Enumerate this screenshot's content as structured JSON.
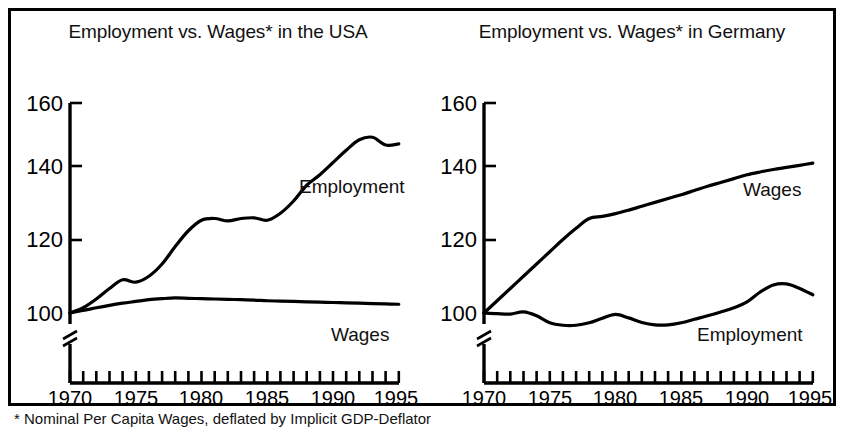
{
  "figure": {
    "footnote": "* Nominal Per Capita Wages, deflated by Implicit GDP-Deflator"
  },
  "chart_data": [
    {
      "type": "line",
      "title": "Employment vs. Wages* in the USA",
      "xlabel": "",
      "ylabel": "",
      "index_base": 100,
      "xlim": [
        1970,
        1995
      ],
      "ylim": [
        100,
        160
      ],
      "axis_break": true,
      "grid": false,
      "legend_position": "inline-labels",
      "xticks": [
        1970,
        1975,
        1980,
        1985,
        1990,
        1995
      ],
      "xtick_labels": [
        "1970",
        "1975",
        "1980",
        "1985",
        "1990",
        "1995"
      ],
      "minor_xticks_every": 1,
      "yticks": [
        100,
        120,
        140,
        160
      ],
      "ytick_labels": [
        "100",
        "120",
        "140",
        "160"
      ],
      "x": [
        1970,
        1971,
        1972,
        1973,
        1974,
        1975,
        1976,
        1977,
        1978,
        1979,
        1980,
        1981,
        1982,
        1983,
        1984,
        1985,
        1986,
        1987,
        1988,
        1989,
        1990,
        1991,
        1992,
        1993,
        1994,
        1995
      ],
      "series": [
        {
          "name": "Employment",
          "label": "Employment",
          "values": [
            100.0,
            101.5,
            104.0,
            107.0,
            109.5,
            108.8,
            110.5,
            114.0,
            119.0,
            123.5,
            126.5,
            127.0,
            126.3,
            127.0,
            127.2,
            126.5,
            128.5,
            132.0,
            136.5,
            139.5,
            143.0,
            146.5,
            149.5,
            150.2,
            148.0,
            148.3,
            155.0
          ]
        },
        {
          "name": "Wages",
          "label": "Wages",
          "values": [
            100.0,
            100.7,
            101.5,
            102.2,
            102.8,
            103.3,
            103.8,
            104.1,
            104.3,
            104.2,
            104.1,
            104.0,
            103.9,
            103.8,
            103.7,
            103.5,
            103.4,
            103.3,
            103.2,
            103.1,
            103.0,
            102.9,
            102.8,
            102.7,
            102.6,
            102.5
          ]
        }
      ]
    },
    {
      "type": "line",
      "title": "Employment vs. Wages* in Germany",
      "xlabel": "",
      "ylabel": "",
      "index_base": 100,
      "xlim": [
        1970,
        1995
      ],
      "ylim": [
        100,
        160
      ],
      "axis_break": true,
      "grid": false,
      "legend_position": "inline-labels",
      "xticks": [
        1970,
        1975,
        1980,
        1985,
        1990,
        1995
      ],
      "xtick_labels": [
        "1970",
        "1975",
        "1980",
        "1985",
        "1990",
        "1995"
      ],
      "minor_xticks_every": 1,
      "yticks": [
        100,
        120,
        140,
        160
      ],
      "ytick_labels": [
        "100",
        "120",
        "140",
        "160"
      ],
      "x": [
        1970,
        1971,
        1972,
        1973,
        1974,
        1975,
        1976,
        1977,
        1978,
        1979,
        1980,
        1981,
        1982,
        1983,
        1984,
        1985,
        1986,
        1987,
        1988,
        1989,
        1990,
        1991,
        1992,
        1993,
        1994,
        1995
      ],
      "series": [
        {
          "name": "Wages",
          "label": "Wages",
          "values": [
            100.0,
            103.5,
            107.0,
            110.5,
            114.0,
            117.5,
            121.0,
            124.2,
            127.0,
            127.6,
            128.4,
            129.4,
            130.5,
            131.6,
            132.7,
            133.8,
            135.0,
            136.2,
            137.3,
            138.4,
            139.5,
            140.3,
            141.0,
            141.6,
            142.2,
            142.8
          ]
        },
        {
          "name": "Employment",
          "label": "Employment",
          "values": [
            100.0,
            99.8,
            99.7,
            100.3,
            99.2,
            97.2,
            96.5,
            96.5,
            97.2,
            98.5,
            99.6,
            98.6,
            97.3,
            96.6,
            96.6,
            97.2,
            98.2,
            99.2,
            100.3,
            101.5,
            103.2,
            106.0,
            108.0,
            108.3,
            107.0,
            105.2
          ]
        }
      ]
    }
  ]
}
